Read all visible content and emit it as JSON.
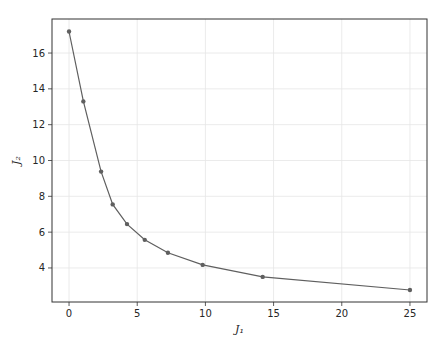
{
  "chart_data": {
    "type": "line",
    "title": "",
    "xlabel": "J₁",
    "ylabel": "J₂",
    "x": [
      0,
      1.05,
      2.35,
      3.2,
      4.25,
      5.55,
      7.25,
      9.8,
      14.2,
      25
    ],
    "series": [
      {
        "name": "J2 vs J1",
        "values": [
          17.2,
          13.3,
          9.38,
          7.55,
          6.45,
          5.57,
          4.85,
          4.17,
          3.5,
          2.77
        ],
        "color": "#5f5f5f",
        "marker": "o"
      }
    ],
    "xlim": [
      -1.25,
      26.25
    ],
    "ylim": [
      2.1,
      17.9
    ],
    "xticks": [
      0,
      5,
      10,
      15,
      20,
      25
    ],
    "yticks": [
      4,
      6,
      8,
      10,
      12,
      14,
      16
    ],
    "grid": true,
    "legend": null
  },
  "colors": {
    "line": "#5f5f5f",
    "grid": "#e6e6e6",
    "frame": "#333333",
    "text": "#262626"
  }
}
